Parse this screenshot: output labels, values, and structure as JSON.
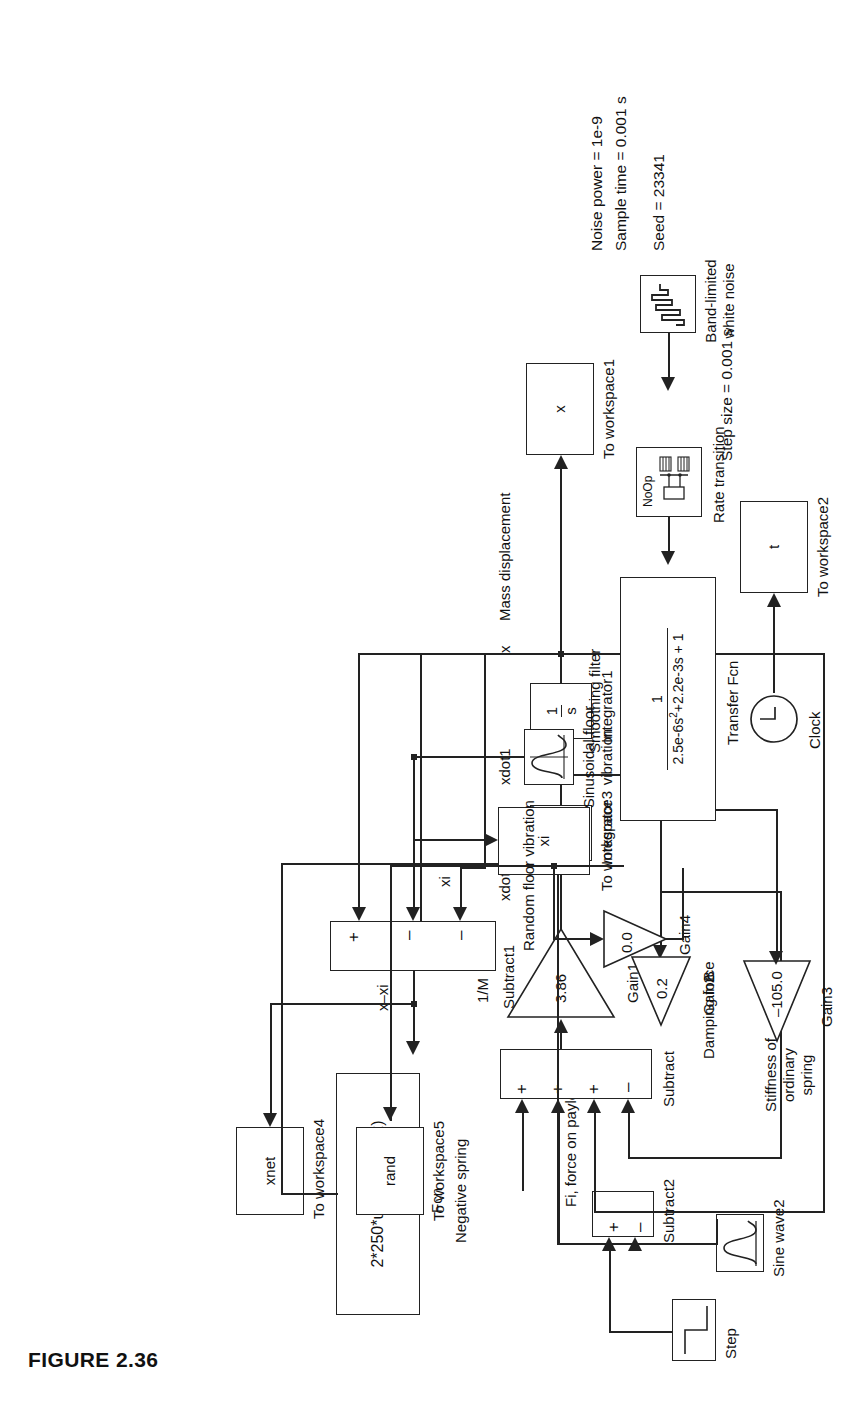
{
  "figure": {
    "caption": "FIGURE 2.36"
  },
  "annotations": {
    "step_size": "Step size = 0.001 s",
    "noise_power": "Noise power = 1e-9",
    "sample_time": "Sample time = 0.001 s",
    "seed": "Seed = 23341"
  },
  "signals": {
    "x": "x",
    "mass_displacement": "Mass displacement",
    "x_minus_xi": "x–xi",
    "xi": "xi",
    "xdot1": "xdot1",
    "xdot2": "xdot2",
    "fi_force": "Fi, force on payload",
    "inv_M": "1/M",
    "B": "B",
    "damping_force": "Damping force",
    "stiffness_ordinary_spring": "Stiffness of\nordinary spring",
    "random_floor_vibration": "Random floor vibration",
    "sinusoidal_floor_vibration": "Sinusoidal floor\nvibration",
    "smoothing_filter": "Smoothing filter"
  },
  "blocks": {
    "to_workspace1": {
      "value": "x",
      "name": "To workspace1"
    },
    "to_workspace2": {
      "value": "t",
      "name": "To workspace2"
    },
    "to_workspace3": {
      "value": "xi",
      "name": "To workspace3"
    },
    "to_workspace4": {
      "value": "xnet",
      "name": "To workspace4"
    },
    "to_workspace5": {
      "value": "rand",
      "name": "To workspace5"
    },
    "clock": {
      "name": "Clock"
    },
    "fcn": {
      "expression": "2*250*u/sqrt(25-u^2)",
      "name": "Fcn",
      "note": "Negative spring"
    },
    "integrator": {
      "num": "1",
      "den": "s",
      "name": "Integrator"
    },
    "integrator1": {
      "num": "1",
      "den": "s",
      "name": "Integrator1"
    },
    "gain1": {
      "value": "3.86",
      "name": "Gain1",
      "note": "1/M"
    },
    "gain2": {
      "value": "0.2",
      "name": "Gain2",
      "note": "B"
    },
    "gain3": {
      "value": "–105.0",
      "name": "Gain3",
      "note": "Stiffness of ordinary spring"
    },
    "gain4": {
      "value": "0.0",
      "name": "Gain4",
      "note": "Random floor vibration"
    },
    "subtract": {
      "name": "Subtract",
      "signs": [
        "+",
        "+",
        "+",
        "–"
      ]
    },
    "subtract1": {
      "name": "Subtract1",
      "signs": [
        "+",
        "–",
        "–"
      ]
    },
    "subtract2": {
      "name": "Subtract2",
      "signs": [
        "+",
        "–"
      ]
    },
    "transfer_fcn": {
      "num": "1",
      "den": "2.5e-6s²+2.2e-3s + 1",
      "name": "Transfer Fcn",
      "note": "Smoothing filter"
    },
    "rate_transition": {
      "value": "NoOp",
      "name": "Rate transition"
    },
    "band_limited_white_noise": {
      "name": "Band-limited\nwhite noise"
    },
    "step": {
      "name": "Step"
    },
    "sine_wave2": {
      "name": "Sine wave2"
    },
    "sine_floor": {
      "name": "Sinusoidal floor\nvibration"
    }
  },
  "colors": {
    "line": "#222222",
    "background": "#ffffff",
    "text": "#111111"
  }
}
